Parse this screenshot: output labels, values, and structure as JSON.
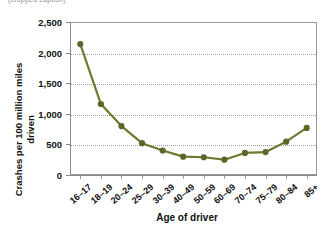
{
  "caption_sliver": "(cropped caption)",
  "chart_data": {
    "type": "line",
    "title": "",
    "xlabel": "Age of driver",
    "ylabel": "Crashes per 100 million miles driven",
    "categories": [
      "16–17",
      "18–19",
      "20–24",
      "25–29",
      "30–39",
      "40–49",
      "50–59",
      "60–69",
      "70–74",
      "75–79",
      "80–84",
      "85+"
    ],
    "values": [
      2140,
      1160,
      800,
      520,
      400,
      300,
      290,
      250,
      360,
      375,
      545,
      770
    ],
    "series": [
      {
        "name": "Crashes per 100 million miles driven",
        "values": [
          2140,
          1160,
          800,
          520,
          400,
          300,
          290,
          250,
          360,
          375,
          545,
          770
        ]
      }
    ],
    "ylim": [
      0,
      2500
    ],
    "yticks": [
      0,
      500,
      1000,
      1500,
      2000,
      2500
    ],
    "ytick_labels": [
      "0",
      "500",
      "1,000",
      "1,500",
      "2,000",
      "2,500"
    ],
    "grid": true,
    "legend": "none",
    "marker": "circle",
    "line_color": "#6b7a2e",
    "marker_color": "#59682a",
    "grid_color": "#9aa0a8",
    "axis_color": "#8a8a8a",
    "background": "#ffffff"
  }
}
